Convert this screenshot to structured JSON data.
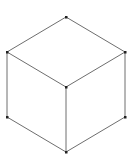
{
  "diagram": {
    "type": "isometric-cube-wireframe",
    "stroke_color": "#6e6e6e",
    "vertex_color": "#222222",
    "vertices": {
      "top": [
        66,
        17
      ],
      "upper_left": [
        7,
        52
      ],
      "upper_right": [
        125,
        52
      ],
      "center": [
        66,
        87
      ],
      "lower_left": [
        7,
        117
      ],
      "lower_right": [
        125,
        117
      ],
      "bottom": [
        66,
        152
      ]
    },
    "edges": [
      [
        "top",
        "upper_left"
      ],
      [
        "top",
        "upper_right"
      ],
      [
        "upper_left",
        "center"
      ],
      [
        "upper_right",
        "center"
      ],
      [
        "upper_left",
        "lower_left"
      ],
      [
        "upper_right",
        "lower_right"
      ],
      [
        "center",
        "bottom"
      ],
      [
        "lower_left",
        "bottom"
      ],
      [
        "lower_right",
        "bottom"
      ]
    ]
  }
}
